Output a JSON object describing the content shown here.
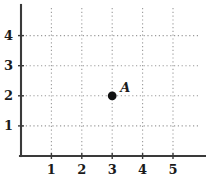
{
  "chart_data": {
    "type": "scatter",
    "title": "",
    "subtitle": "",
    "xlabel": "",
    "ylabel": "",
    "xlim": [
      0,
      6.05
    ],
    "ylim": [
      0,
      5.05
    ],
    "grid": true,
    "grid_style": "dotted",
    "legend": "none",
    "x_ticks": [
      1,
      2,
      3,
      4,
      5
    ],
    "y_ticks": [
      1,
      2,
      3,
      4
    ],
    "x_tick_labels": [
      "1",
      "2",
      "3",
      "4",
      "5"
    ],
    "y_tick_labels": [
      "1",
      "2",
      "3",
      "4"
    ],
    "points": [
      {
        "label": "A",
        "x": 3,
        "y": 2
      }
    ],
    "series": [
      {
        "name": "points",
        "x": [
          3
        ],
        "y": [
          2
        ],
        "labels": [
          "A"
        ]
      }
    ],
    "colors": {
      "axis": "#3a3a3a",
      "grid": "#9a9a9a",
      "point": "#111111",
      "text": "#1a1a1a",
      "background": "#ffffff"
    }
  },
  "geometry": {
    "origin_x": 21,
    "origin_y": 156,
    "x_unit": 30.4,
    "y_unit": 30.1,
    "axis_top": 5,
    "axis_right": 206,
    "grid_top": 8,
    "grid_right": 200,
    "point_radius": 4.4,
    "tick_len": 5
  },
  "figure": {
    "name": "coordinate-plane-point-a",
    "width": 206,
    "height": 177
  }
}
